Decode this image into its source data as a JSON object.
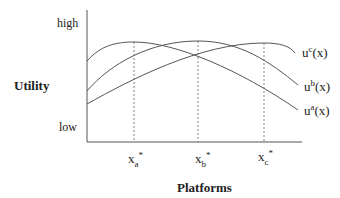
{
  "axes": {
    "y_title": "Utility",
    "y_high": "high",
    "y_low": "low",
    "x_title": "Platforms"
  },
  "curves": [
    {
      "id": "a",
      "base": "u",
      "sup": "a",
      "arg": "(x)"
    },
    {
      "id": "b",
      "base": "u",
      "sup": "b",
      "arg": "(x)"
    },
    {
      "id": "c",
      "base": "u",
      "sup": "c",
      "arg": "(x)"
    }
  ],
  "optima": [
    {
      "base": "x",
      "sub": "a",
      "sup": "*"
    },
    {
      "base": "x",
      "sub": "b",
      "sup": "*"
    },
    {
      "base": "x",
      "sub": "c",
      "sup": "*"
    }
  ],
  "colors": {
    "line": "#555555",
    "text": "#222222"
  }
}
